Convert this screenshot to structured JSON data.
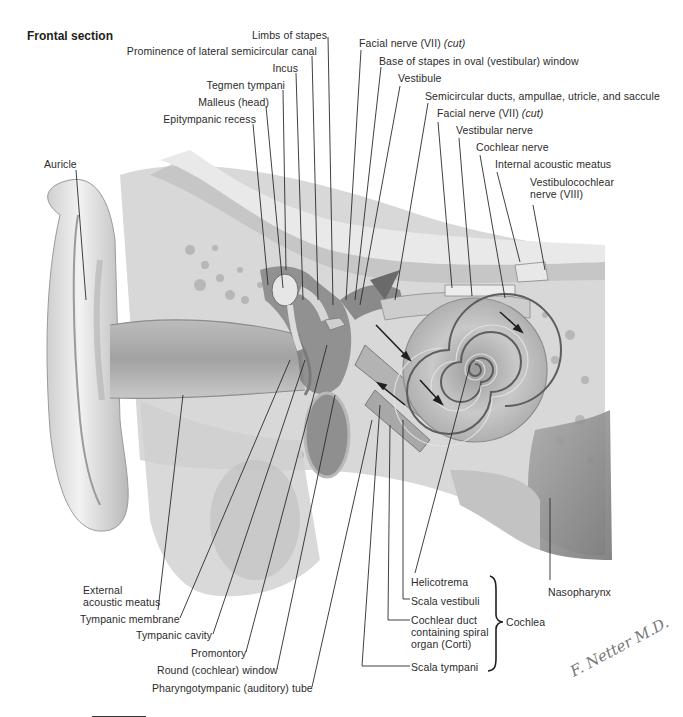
{
  "title": "Frontal section",
  "labels_top": {
    "limbs_of_stapes": "Limbs of stapes",
    "prominence_lateral_canal": "Prominence of lateral semicircular canal",
    "incus": "Incus",
    "tegmen_tympani": "Tegmen tympani",
    "malleus_head": "Malleus (head)",
    "epitympanic_recess": "Epitympanic recess",
    "facial_nerve_1": "Facial nerve (VII)",
    "facial_nerve_1_note": "(cut)",
    "base_of_stapes": "Base of stapes in oval (vestibular) window",
    "vestibule": "Vestibule",
    "semicircular_ducts": "Semicircular ducts, ampullae, utricle, and saccule",
    "facial_nerve_2": "Facial nerve (VII)",
    "facial_nerve_2_note": "(cut)",
    "vestibular_nerve": "Vestibular nerve",
    "cochlear_nerve": "Cochlear nerve",
    "internal_acoustic_meatus": "Internal acoustic meatus",
    "vestibulocochlear_1": "Vestibulocochlear",
    "vestibulocochlear_2": "nerve (VIII)",
    "auricle": "Auricle"
  },
  "labels_bottom": {
    "external_meatus_1": "External",
    "external_meatus_2": "acoustic meatus",
    "tympanic_membrane": "Tympanic membrane",
    "tympanic_cavity": "Tympanic cavity",
    "promontory": "Promontory",
    "round_window": "Round (cochlear) window",
    "pharyngotympanic_tube": "Pharyngotympanic (auditory) tube",
    "helicotrema": "Helicotrema",
    "scala_vestibuli": "Scala vestibuli",
    "cochlear_duct_1": "Cochlear duct",
    "cochlear_duct_2": "containing spiral",
    "cochlear_duct_3": "organ (Corti)",
    "scala_tympani": "Scala tympani",
    "cochlea": "Cochlea",
    "nasopharynx": "Nasopharynx"
  },
  "signature": "F. Netter M.D.",
  "colors": {
    "bone": "#d9d9d9",
    "dark": "#5a5a5a",
    "soft": "#bdbdbd",
    "line": "#2b2b2b"
  }
}
